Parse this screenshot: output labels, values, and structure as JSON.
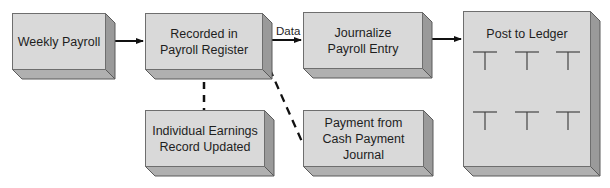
{
  "diagram": {
    "boxes": [
      {
        "id": "weekly-payroll",
        "label": "Weekly Payroll"
      },
      {
        "id": "payroll-register",
        "label": "Recorded in\nPayroll Register"
      },
      {
        "id": "journalize",
        "label": "Journalize\nPayroll Entry"
      },
      {
        "id": "ledger",
        "label": "Post to Ledger"
      },
      {
        "id": "earnings-record",
        "label": "Individual Earnings\nRecord Updated"
      },
      {
        "id": "cash-payment",
        "label": "Payment from\nCash Payment\nJournal"
      }
    ],
    "edges": [
      {
        "from": "weekly-payroll",
        "to": "payroll-register",
        "style": "solid-arrow",
        "label": ""
      },
      {
        "from": "payroll-register",
        "to": "journalize",
        "style": "solid-arrow",
        "label": "Data"
      },
      {
        "from": "journalize",
        "to": "ledger",
        "style": "solid-arrow",
        "label": ""
      },
      {
        "from": "payroll-register",
        "to": "earnings-record",
        "style": "dashed",
        "label": ""
      },
      {
        "from": "payroll-register",
        "to": "cash-payment",
        "style": "dashed",
        "label": ""
      }
    ],
    "ledger_t_accounts": 6,
    "colors": {
      "face": "#d9d9d9",
      "side": "#9a9a9a",
      "bottom": "#b0b0b0",
      "stroke": "#5a5a5a",
      "line": "#111111"
    }
  }
}
